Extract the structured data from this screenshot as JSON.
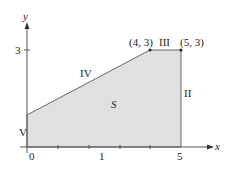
{
  "diagram": {
    "region_label": "S",
    "axes": {
      "x_label": "x",
      "y_label": "y"
    },
    "ticks": {
      "x": [
        "0",
        "1",
        "5"
      ],
      "y": [
        "3"
      ]
    },
    "vertices": [
      {
        "label": "(4, 3)",
        "x": 4,
        "y": 3
      },
      {
        "label": "(5, 3)",
        "x": 5,
        "y": 3
      }
    ],
    "edges": {
      "I": "I",
      "II": "II",
      "III": "III",
      "IV": "IV",
      "V": "V"
    },
    "colors": {
      "fill": "#e0e0e0",
      "stroke": "#555555"
    }
  }
}
